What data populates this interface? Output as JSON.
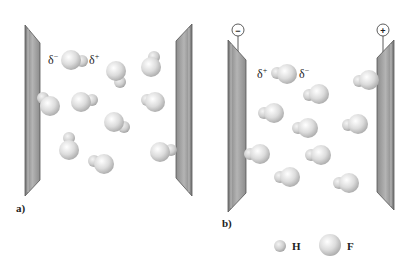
{
  "panels": [
    {
      "label": "a)",
      "field": "none",
      "plates": {
        "left_terminal": "",
        "right_terminal": ""
      },
      "dipole_labels": {
        "left": "δ",
        "left_sup": "−",
        "right": "δ",
        "right_sup": "+"
      }
    },
    {
      "label": "b)",
      "field": "applied",
      "plates": {
        "left_terminal": "−",
        "right_terminal": "+"
      },
      "dipole_labels": {
        "left": "δ",
        "left_sup": "+",
        "right": "δ",
        "right_sup": "−"
      }
    }
  ],
  "legend": {
    "items": [
      {
        "symbol": "small-sphere",
        "label": "H"
      },
      {
        "symbol": "large-sphere",
        "label": "F"
      }
    ]
  },
  "colors": {
    "plate_face": "#9a9a9a",
    "plate_edge": "#555555",
    "sphere_light": "#ffffff",
    "sphere_dark": "#b5b5b5"
  }
}
